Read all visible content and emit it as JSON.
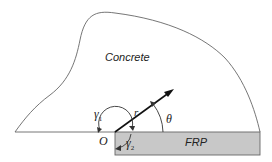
{
  "diagram": {
    "region_labels": {
      "concrete": "Concrete",
      "frp": "FRP"
    },
    "symbols": {
      "origin": "O",
      "radius": "r",
      "theta": "θ",
      "gamma1": "γ",
      "gamma1_sub": "1",
      "gamma2": "γ",
      "gamma2_sub": "2"
    },
    "colors": {
      "frp_fill": "#c8c8c8",
      "outline": "#555555",
      "arrow": "#111111"
    }
  }
}
